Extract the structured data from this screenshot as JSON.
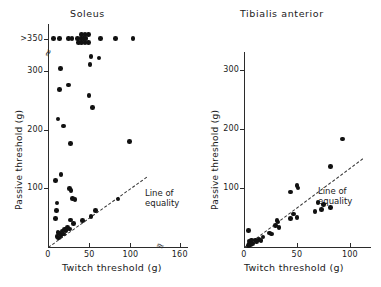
{
  "figure": {
    "background": "#ffffff",
    "point_color": "#111111",
    "axis_color": "#2b2b2b"
  },
  "chart_data": [
    {
      "type": "scatter",
      "title": "Soleus",
      "xlabel": "Twitch threshold (g)",
      "ylabel": "Passive threshold (g)",
      "xlim": [
        0,
        170
      ],
      "ylim": [
        0,
        380
      ],
      "grid": false,
      "legend": "none",
      "xticks": [
        0,
        50,
        100,
        160
      ],
      "xticklabels": [
        "0",
        "50",
        "100",
        "160"
      ],
      "yticks": [
        100,
        200,
        300,
        355
      ],
      "yticklabels": [
        "100",
        "200",
        "300",
        ">350"
      ],
      "axis_break_x": true,
      "axis_break_y": true,
      "annotations": [
        {
          "text": "Line of equality",
          "line1": "Line of",
          "line2": "equality"
        }
      ],
      "reference_line": {
        "name": "line of equality",
        "style": "dashed",
        "from": [
          0,
          0
        ],
        "to": [
          120,
          120
        ]
      },
      "points": [
        [
          7,
          355
        ],
        [
          14,
          355
        ],
        [
          25,
          355
        ],
        [
          29,
          355
        ],
        [
          36,
          355
        ],
        [
          40,
          355
        ],
        [
          43,
          355
        ],
        [
          46,
          355
        ],
        [
          41,
          362
        ],
        [
          45,
          362
        ],
        [
          49,
          362
        ],
        [
          37,
          348
        ],
        [
          41,
          348
        ],
        [
          45,
          348
        ],
        [
          49,
          348
        ],
        [
          64,
          355
        ],
        [
          82,
          355
        ],
        [
          103,
          355
        ],
        [
          52,
          325
        ],
        [
          62,
          322
        ],
        [
          15,
          304
        ],
        [
          51,
          311
        ],
        [
          14,
          268
        ],
        [
          25,
          276
        ],
        [
          50,
          258
        ],
        [
          54,
          238
        ],
        [
          12,
          218
        ],
        [
          19,
          206
        ],
        [
          99,
          180
        ],
        [
          27,
          176
        ],
        [
          16,
          124
        ],
        [
          9,
          113
        ],
        [
          26,
          100
        ],
        [
          28,
          96
        ],
        [
          30,
          83
        ],
        [
          33,
          81
        ],
        [
          11,
          75
        ],
        [
          85,
          82
        ],
        [
          10,
          62
        ],
        [
          9,
          49
        ],
        [
          27,
          46
        ],
        [
          31,
          40
        ],
        [
          58,
          62
        ],
        [
          52,
          52
        ],
        [
          42,
          45
        ],
        [
          12,
          25
        ],
        [
          14,
          23
        ],
        [
          17,
          27
        ],
        [
          20,
          30
        ],
        [
          22,
          28
        ],
        [
          24,
          33
        ],
        [
          26,
          31
        ],
        [
          11,
          18
        ],
        [
          13,
          15
        ],
        [
          16,
          20
        ],
        [
          19,
          22
        ]
      ]
    },
    {
      "type": "scatter",
      "title": "Tibialis anterior",
      "xlabel": "Twitch threshold (g)",
      "ylabel": "Passive threshold (g)",
      "xlim": [
        0,
        120
      ],
      "ylim": [
        0,
        330
      ],
      "grid": false,
      "legend": "none",
      "xticks": [
        0,
        50,
        100
      ],
      "xticklabels": [
        "0",
        "50",
        "100"
      ],
      "yticks": [
        100,
        200,
        300
      ],
      "yticklabels": [
        "100",
        "200",
        "300"
      ],
      "axis_break_x": false,
      "axis_break_y": false,
      "annotations": [
        {
          "text": "Line of equality",
          "line1": "Line of",
          "line2": "equality"
        }
      ],
      "reference_line": {
        "name": "line of equality",
        "style": "dashed",
        "from": [
          0,
          0
        ],
        "to": [
          112,
          150
        ]
      },
      "points": [
        [
          93,
          183
        ],
        [
          82,
          136
        ],
        [
          50,
          104
        ],
        [
          51,
          100
        ],
        [
          44,
          93
        ],
        [
          70,
          75
        ],
        [
          75,
          72
        ],
        [
          73,
          63
        ],
        [
          82,
          67
        ],
        [
          67,
          60
        ],
        [
          47,
          56
        ],
        [
          50,
          50
        ],
        [
          44,
          48
        ],
        [
          31,
          45
        ],
        [
          32,
          42
        ],
        [
          30,
          36
        ],
        [
          33,
          33
        ],
        [
          24,
          24
        ],
        [
          26,
          22
        ],
        [
          18,
          17
        ],
        [
          14,
          13
        ],
        [
          16,
          11
        ],
        [
          11,
          12
        ],
        [
          12,
          9
        ],
        [
          4,
          28
        ],
        [
          5,
          10
        ],
        [
          6,
          8
        ],
        [
          7,
          12
        ],
        [
          5,
          6
        ],
        [
          6,
          4
        ],
        [
          8,
          6
        ],
        [
          4,
          3
        ]
      ]
    }
  ]
}
